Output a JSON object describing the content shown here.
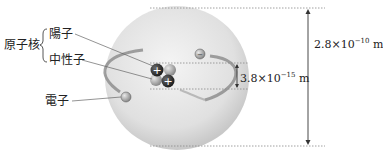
{
  "labels": {
    "nucleus": "原子核",
    "proton": "陽子",
    "neutron": "中性子",
    "electron": "電子"
  },
  "dimensions": {
    "atom": {
      "mantissa": "2.8×10",
      "exponent": "−10",
      "unit": " m"
    },
    "nucleus": {
      "mantissa": "3.8×10",
      "exponent": "−15",
      "unit": " m"
    }
  },
  "colors": {
    "atom_sphere": "#e2e2e2",
    "orbit": "#8a8a8a",
    "proton": "#2b2b2b",
    "neutron": "#9a9a9a",
    "electron": "#7a7a7a",
    "text": "#222222"
  },
  "icons": {
    "proton_sign": "+",
    "electron_sign": "−"
  }
}
